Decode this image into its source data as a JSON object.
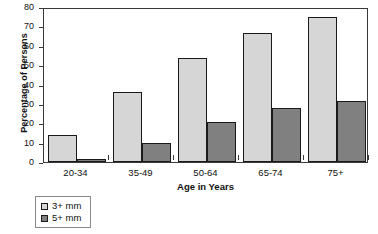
{
  "chart_data": {
    "type": "bar",
    "title": "",
    "xlabel": "Age in Years",
    "ylabel": "Percentage of Persons",
    "categories": [
      "20-34",
      "35-49",
      "50-64",
      "65-74",
      "75+"
    ],
    "series": [
      {
        "name": "3+ mm",
        "values": [
          13.8,
          36.0,
          53.5,
          66.7,
          75.0
        ],
        "color": "#d6d6d6"
      },
      {
        "name": "5+ mm",
        "values": [
          1.7,
          9.7,
          20.4,
          28.0,
          31.3
        ],
        "color": "#808080"
      }
    ],
    "ylim": [
      0,
      80
    ],
    "yticks": [
      0,
      10,
      20,
      30,
      40,
      50,
      60,
      70,
      80
    ],
    "ytick_labels": [
      "0",
      "10",
      "20",
      "30",
      "40",
      "50",
      "60",
      "70",
      "80"
    ],
    "grid": false,
    "legend_position": "below-left",
    "legend_entries": [
      "3+ mm",
      "5+ mm"
    ]
  }
}
